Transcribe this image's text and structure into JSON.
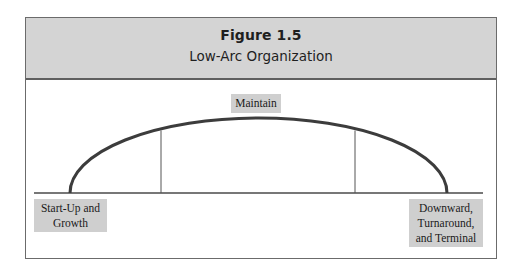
{
  "figure": {
    "number": "Figure 1.5",
    "title": "Low-Arc Organization"
  },
  "diagram": {
    "type": "lifecycle-arc",
    "stages": [
      {
        "id": "start",
        "label": "Start-Up and\nGrowth",
        "position": "left-baseline"
      },
      {
        "id": "maintain",
        "label": "Maintain",
        "position": "top-center"
      },
      {
        "id": "decline",
        "label": "Downward,\nTurnaround,\nand Terminal",
        "position": "right-baseline"
      }
    ],
    "dividers": 2,
    "colors": {
      "header_background": "#d4d4d4",
      "label_background": "#cfcfcf",
      "line": "#3c3c3c",
      "frame": "#6b6b6b"
    }
  }
}
